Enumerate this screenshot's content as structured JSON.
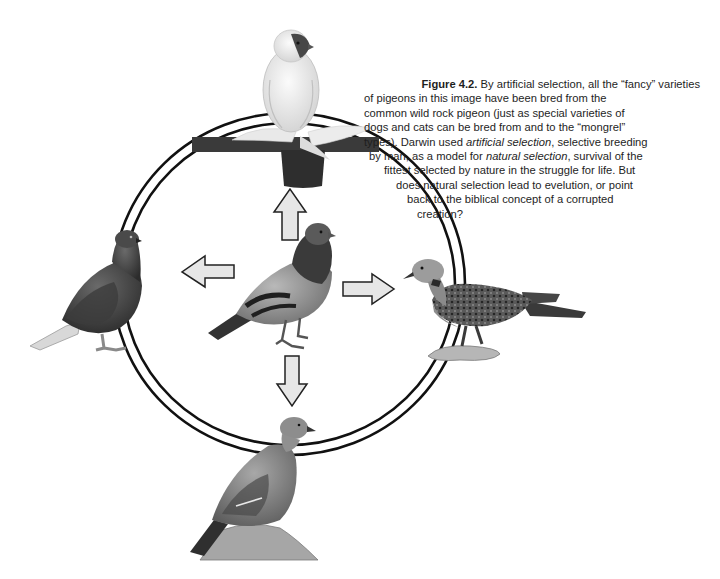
{
  "figure": {
    "label": "Figure 4.2.",
    "caption_lines": [
      {
        "parts": [
          {
            "t": "Figure 4.2.",
            "s": "bold"
          },
          {
            "t": " By artificial selection, all the “fancy” varieties",
            "s": "normal"
          }
        ],
        "indent": 0
      },
      {
        "parts": [
          {
            "t": "of pigeons  in this image have been bred from the",
            "s": "normal"
          }
        ],
        "indent": 0
      },
      {
        "parts": [
          {
            "t": "common wild rock pigeon (just as special varieties of",
            "s": "normal"
          }
        ],
        "indent": 0
      },
      {
        "parts": [
          {
            "t": "dogs and cats can be bred from and to the “mongrel”",
            "s": "normal"
          }
        ],
        "indent": 0
      },
      {
        "parts": [
          {
            "t": "types). Darwin used ",
            "s": "normal"
          },
          {
            "t": "artificial selection",
            "s": "italic"
          },
          {
            "t": ", selective breeding",
            "s": "normal"
          }
        ],
        "indent": 0
      },
      {
        "parts": [
          {
            "t": "by man, as a model for ",
            "s": "normal"
          },
          {
            "t": "natural selection",
            "s": "italic"
          },
          {
            "t": ", survival of the",
            "s": "normal"
          }
        ],
        "indent": 4
      },
      {
        "parts": [
          {
            "t": "fittest selected by nature in the struggle for life. But",
            "s": "normal"
          }
        ],
        "indent": 18
      },
      {
        "parts": [
          {
            "t": "does natural selection lead to evelution, or point",
            "s": "normal"
          }
        ],
        "indent": 32
      },
      {
        "parts": [
          {
            "t": "back to the biblical concept of a corrupted",
            "s": "normal"
          }
        ],
        "indent": 42
      },
      {
        "parts": [
          {
            "t": "creation?",
            "s": "normal"
          }
        ],
        "indent": 52
      }
    ],
    "caption_text": "Figure 4.2. By artificial selection, all the “fancy” varieties of pigeons  in this image have been bred from the common wild rock pigeon (just as special varieties of dogs and cats can be bred from and to the “mongrel” types). Darwin used artificial selection, selective breeding by man, as a model for natural selection, survival of the fittest selected by nature in the struggle for life. But does natural selection lead to evelution, or point back to the biblical concept of a corrupted creation?",
    "diagram": {
      "center_bird": "rock-pigeon",
      "ring_birds": [
        {
          "position": "top",
          "bird": "fantail-pigeon-on-perch"
        },
        {
          "position": "left",
          "bird": "dark-pouter-pigeon"
        },
        {
          "position": "right",
          "bird": "turtle-dove"
        },
        {
          "position": "bottom",
          "bird": "wood-pigeon-on-rock"
        }
      ],
      "arrows": [
        "up",
        "left",
        "right",
        "down"
      ],
      "colors": {
        "ring": "#111111",
        "arrow_fill": "#e6e6e6",
        "arrow_stroke": "#222222",
        "perch": "#3a3a3a"
      }
    }
  }
}
